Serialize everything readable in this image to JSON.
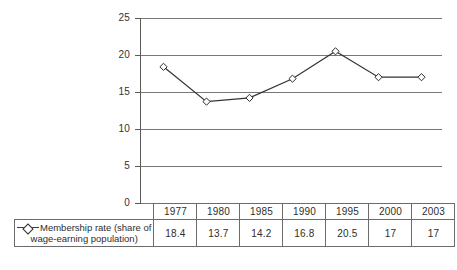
{
  "chart_data": {
    "type": "line",
    "title": "",
    "xlabel": "",
    "ylabel": "",
    "categories": [
      "1977",
      "1980",
      "1985",
      "1990",
      "1995",
      "2000",
      "2003"
    ],
    "series": [
      {
        "name": "Membership rate (share of wage-earning population)",
        "values": [
          18.4,
          13.7,
          14.2,
          16.8,
          20.5,
          17,
          17
        ],
        "marker": "diamond",
        "marker_fill": "#ffffff",
        "line_color": "#333333"
      }
    ],
    "ylim": [
      0,
      25
    ],
    "yticks": [
      0,
      5,
      10,
      15,
      20,
      25
    ],
    "ytick_labels": [
      "0",
      "5",
      "10",
      "15",
      "20",
      "25"
    ],
    "grid": true,
    "grid_axis": "y",
    "legend_position": "bottom-left-table",
    "has_data_table": true
  },
  "axis": {
    "y_labels": [
      "25",
      "20",
      "15",
      "10",
      "5",
      "0"
    ]
  },
  "legend": {
    "marker_icon": "diamond-marker-icon",
    "label_line1": "Membership rate (share of",
    "label_line2": "wage-earning population)"
  },
  "table": {
    "years": [
      "1977",
      "1980",
      "1985",
      "1990",
      "1995",
      "2000",
      "2003"
    ],
    "values": [
      "18.4",
      "13.7",
      "14.2",
      "16.8",
      "20.5",
      "17",
      "17"
    ]
  },
  "colors": {
    "grid": "#777777",
    "axis": "#5a5a5a",
    "line": "#333333",
    "marker_fill": "#ffffff",
    "marker_stroke": "#2b2b2b",
    "text": "#2e2e2e",
    "table_border": "#6b6b6b",
    "background": "#ffffff"
  }
}
